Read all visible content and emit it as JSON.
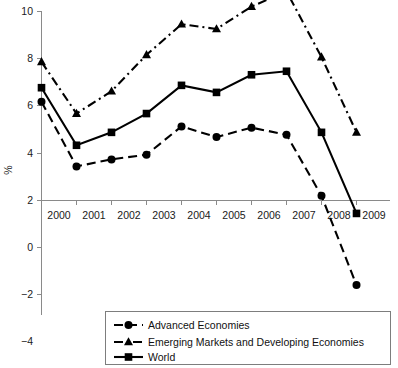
{
  "chart_data": {
    "type": "line",
    "title": "",
    "subtitle": "",
    "xlabel": "",
    "ylabel": "%",
    "categories": [
      "2000",
      "2001",
      "2002",
      "2003",
      "2004",
      "2005",
      "2006",
      "2007",
      "2008",
      "2009"
    ],
    "x": [
      2000,
      2001,
      2002,
      2003,
      2004,
      2005,
      2006,
      2007,
      2008,
      2009
    ],
    "xlim": [
      2000,
      2009
    ],
    "ylim": [
      -6,
      10
    ],
    "yticks": [
      10,
      8,
      6,
      4,
      2,
      0,
      -2,
      -4,
      -6
    ],
    "ytick_labels": [
      "10",
      "8",
      "6",
      "4",
      "2",
      "0",
      "−2",
      "−4",
      "−6"
    ],
    "grid": false,
    "legend_position": "bottom-center",
    "series": [
      {
        "name": "Advanced Economies",
        "marker": "circle",
        "line_style": "dashed",
        "color": "#000000",
        "values": [
          4.2,
          1.45,
          1.75,
          1.95,
          3.15,
          2.7,
          3.1,
          2.8,
          0.2,
          -3.6
        ]
      },
      {
        "name": "Emerging Markets and Developing Economies",
        "marker": "triangle",
        "line_style": "dash-dot",
        "color": "#000000",
        "values": [
          5.9,
          3.7,
          4.65,
          6.2,
          7.5,
          7.3,
          8.25,
          8.9,
          6.1,
          2.9
        ]
      },
      {
        "name": "World",
        "marker": "square",
        "line_style": "solid",
        "color": "#000000",
        "values": [
          4.8,
          2.35,
          2.9,
          3.7,
          4.9,
          4.6,
          5.35,
          5.5,
          2.9,
          -0.55
        ]
      }
    ]
  },
  "legend": {
    "items": [
      {
        "label": "Advanced Economies",
        "marker": "circle",
        "line_style": "dashed"
      },
      {
        "label": "Emerging Markets and Developing Economies",
        "marker": "triangle",
        "line_style": "dash-dot"
      },
      {
        "label": "World",
        "marker": "square",
        "line_style": "solid"
      }
    ]
  },
  "axes": {
    "y_title": "%",
    "y_labels": [
      "10",
      "8",
      "6",
      "4",
      "2",
      "0",
      "−2",
      "−4",
      "−6"
    ],
    "x_labels": [
      "2000",
      "2001",
      "2002",
      "2003",
      "2004",
      "2005",
      "2006",
      "2007",
      "2008",
      "2009"
    ]
  }
}
